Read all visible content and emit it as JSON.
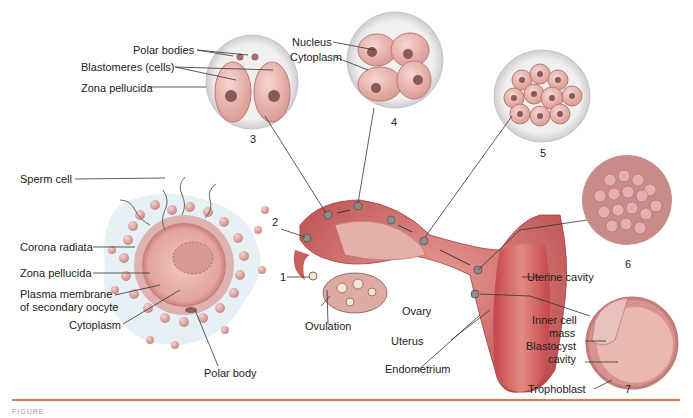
{
  "figure": {
    "stages": [
      {
        "num": "1",
        "name": "ovulation-oocyte"
      },
      {
        "num": "2",
        "name": "fertilization"
      },
      {
        "num": "3",
        "name": "two-cell-stage"
      },
      {
        "num": "4",
        "name": "four-cell-stage"
      },
      {
        "num": "5",
        "name": "morula-early"
      },
      {
        "num": "6",
        "name": "morula"
      },
      {
        "num": "7",
        "name": "blastocyst"
      }
    ],
    "labels": {
      "polar_bodies": "Polar bodies",
      "blastomeres": "Blastomeres (cells)",
      "zona_pellucida_top": "Zona pellucida",
      "nucleus": "Nucleus",
      "cytoplasm_top": "Cytoplasm",
      "sperm_cell": "Sperm cell",
      "corona_radiata": "Corona radiata",
      "zona_pellucida": "Zona pellucida",
      "plasma_membrane_1": "Plasma membrane",
      "plasma_membrane_2": "of secondary oocyte",
      "cytoplasm": "Cytoplasm",
      "polar_body": "Polar body",
      "ovulation": "Ovulation",
      "ovary": "Ovary",
      "uterus": "Uterus",
      "endometrium": "Endometrium",
      "uterine_cavity": "Uterine cavity",
      "inner_cell_1": "Inner cell",
      "inner_cell_2": "mass",
      "blastocyst_1": "Blastocyst",
      "blastocyst_2": "cavity",
      "trophoblast": "Trophoblast"
    },
    "caption": "FIGURE",
    "colors": {
      "accent_rule": "#e07a4a",
      "cell_pink": "#e9b3ad",
      "tissue_red": "#c8585a",
      "zona": "#e6e3e6"
    }
  }
}
